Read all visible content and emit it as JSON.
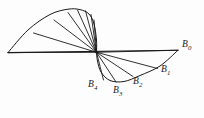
{
  "figure": {
    "kind": "geometric-diagram",
    "background_color": "#fdfdfd",
    "stroke_color": "#1a1a1a",
    "stroke_width": 0.9,
    "canvas": {
      "width": 204,
      "height": 118
    },
    "center_vertex": {
      "x": 96.5,
      "y": 52.3
    },
    "axis_line": {
      "x1": 8,
      "y1": 52.6,
      "x2": 178,
      "y2": 50.2
    },
    "upper_fan_rays": [
      {
        "x": 8,
        "y": 52.6
      },
      {
        "x": 33.5,
        "y": 33.0
      },
      {
        "x": 54.0,
        "y": 20.0
      },
      {
        "x": 68.0,
        "y": 12.5
      },
      {
        "x": 77.5,
        "y": 10.0
      },
      {
        "x": 85.5,
        "y": 10.8
      },
      {
        "x": 91.0,
        "y": 14.5
      },
      {
        "x": 94.0,
        "y": 20.0
      }
    ],
    "upper_envelope": [
      {
        "x": 8,
        "y": 52.6
      },
      {
        "x": 28,
        "y": 30.0
      },
      {
        "x": 50,
        "y": 14.5
      },
      {
        "x": 68,
        "y": 9.2
      },
      {
        "x": 80,
        "y": 9.6
      },
      {
        "x": 89,
        "y": 14.0
      },
      {
        "x": 94,
        "y": 24.0
      },
      {
        "x": 96.5,
        "y": 40.0
      },
      {
        "x": 96.5,
        "y": 52.3
      }
    ],
    "lower_fan_rays": [
      {
        "id": "B0",
        "x": 178.0,
        "y": 50.2
      },
      {
        "id": "B1",
        "x": 157.5,
        "y": 68.5
      },
      {
        "id": "B2",
        "x": 133.0,
        "y": 76.5
      },
      {
        "id": "B3",
        "x": 116.0,
        "y": 82.0
      },
      {
        "id": "B4",
        "x": 103.5,
        "y": 80.0
      }
    ],
    "lower_envelope": [
      {
        "x": 178.0,
        "y": 50.2
      },
      {
        "x": 160.0,
        "y": 66.0
      },
      {
        "x": 140.0,
        "y": 75.5
      },
      {
        "x": 124.0,
        "y": 81.5
      },
      {
        "x": 110.0,
        "y": 80.5
      },
      {
        "x": 101.0,
        "y": 72.0
      },
      {
        "x": 97.5,
        "y": 61.0
      },
      {
        "x": 96.5,
        "y": 52.3
      }
    ],
    "labels": [
      {
        "name": "B0",
        "base": "B",
        "sub": "0",
        "x": 182,
        "y": 39.5
      },
      {
        "name": "B1",
        "base": "B",
        "sub": "1",
        "x": 161,
        "y": 64.5
      },
      {
        "name": "B2",
        "base": "B",
        "sub": "2",
        "x": 133,
        "y": 77.0
      },
      {
        "name": "B3",
        "base": "B",
        "sub": "3",
        "x": 113,
        "y": 85.5
      },
      {
        "name": "B4",
        "base": "B",
        "sub": "4",
        "x": 88,
        "y": 79.5
      }
    ]
  }
}
